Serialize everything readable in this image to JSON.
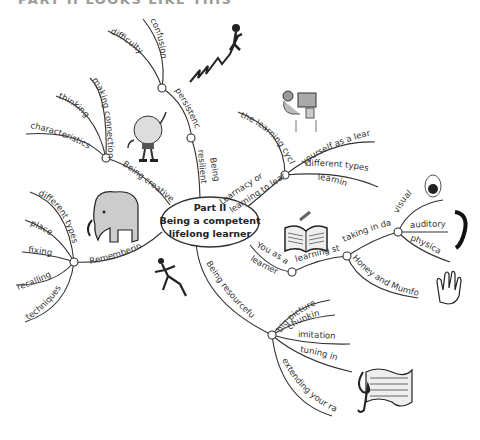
{
  "page": {
    "title": "PART II LOOKS LIKE THIS"
  },
  "center": {
    "line1": "Part II",
    "line2": "Being a competent",
    "line3": "lifelong learner"
  },
  "branches": {
    "resilient": {
      "label1": "Being",
      "label2": "resilient",
      "persistence": "persistence",
      "difficulty": "difficulty",
      "confusion": "confusion"
    },
    "creative": {
      "label": "Being creative",
      "characteristics": "characteristics",
      "thinking": "thinking",
      "making_connections": "making connections"
    },
    "remembering": {
      "label": "Remembering",
      "different_types": "different types",
      "place": "place",
      "fixing": "fixing",
      "recalling": "recalling",
      "techniques": "techniques"
    },
    "learnacy": {
      "label1": "Learnacy or",
      "label2": "learning to learn",
      "learning_cycle": "the learning cycle",
      "yourself": "yourself as a learner",
      "types1": "different types of",
      "types2": "learning"
    },
    "learner": {
      "label1": "You as a",
      "label2": "learner",
      "styles": "learning styles",
      "taking_in": "taking in data",
      "visual": "visual",
      "auditory": "auditory",
      "physical": "physical",
      "honey": "Honey and Mumford"
    },
    "resourceful": {
      "label": "Being resourceful",
      "big_picture": "big picture",
      "chunking": "chunking",
      "imitation": "imitation",
      "tuning_in": "tuning in",
      "extending": "extending your range"
    }
  },
  "illustrations": [
    "climber-on-zigzag",
    "lightbulb-character",
    "elephant",
    "person-at-computer",
    "open-book",
    "eye",
    "ear",
    "hand",
    "running-figure",
    "sheet-music"
  ]
}
